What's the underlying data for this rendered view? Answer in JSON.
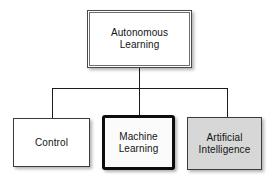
{
  "diagram": {
    "type": "hierarchy",
    "root": {
      "label": "Autonomous\nLearning"
    },
    "children": [
      {
        "id": "control",
        "label": "Control",
        "fill": "#ffffff",
        "border_style": "thin"
      },
      {
        "id": "machine-learning",
        "label": "Machine\nLearning",
        "fill": "#fbfbfb",
        "border_style": "thick"
      },
      {
        "id": "artificial-intelligence",
        "label": "Artificial\nIntelligence",
        "fill": "#d7d7d7",
        "border_style": "thin"
      }
    ],
    "colors": {
      "background": "#ffffff",
      "connector_line": "#1c1c1c",
      "thin_border": "#3c3c3c",
      "thick_border": "#0d0d0d",
      "double_border_outer": "#4a4a4a",
      "double_border_inner": "#6e6e6e",
      "gray_fill": "#d7d7d7",
      "text": "#141414"
    }
  }
}
